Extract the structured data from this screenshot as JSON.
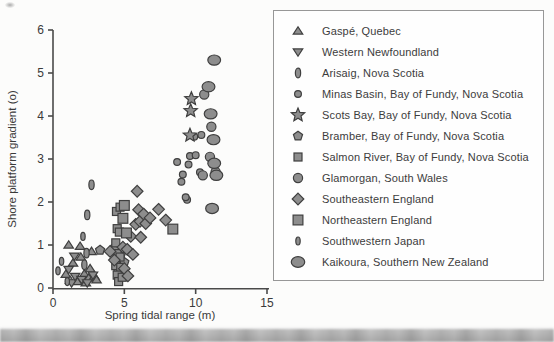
{
  "figure": {
    "background": "#fcfcfb",
    "axis_color": "#4a4a4a",
    "text_color": "#3a3a3a",
    "legend_border_color": "#979797",
    "marker_fill": "#8d8d8d",
    "marker_stroke": "#3f3f3f"
  },
  "chart_data": {
    "type": "scatter",
    "title": "",
    "xlabel": "Spring tidal range (m)",
    "ylabel": "Shore platform gradient (o)",
    "xlim": [
      0,
      15
    ],
    "ylim": [
      0,
      6
    ],
    "xticks": [
      0,
      5,
      10,
      15
    ],
    "yticks": [
      0,
      1,
      2,
      3,
      4,
      5,
      6
    ],
    "grid": false,
    "legend_position": "right-box",
    "series": [
      {
        "name": "Gaspé, Quebec",
        "marker": "triangle-up",
        "size": 5,
        "points": [
          [
            0.9,
            0.32
          ],
          [
            1.1,
            1.0
          ],
          [
            1.2,
            0.18
          ],
          [
            1.4,
            0.58
          ],
          [
            1.7,
            0.15
          ],
          [
            1.9,
            0.97
          ],
          [
            1.95,
            0.72
          ],
          [
            2.2,
            0.33
          ],
          [
            2.3,
            0.12
          ],
          [
            2.5,
            0.23
          ],
          [
            2.6,
            0.45
          ],
          [
            2.7,
            0.85
          ],
          [
            2.9,
            0.28
          ],
          [
            3.05,
            0.19
          ]
        ]
      },
      {
        "name": "Western Newfoundland",
        "marker": "triangle-down",
        "size": 5,
        "points": [
          [
            1.1,
            0.43
          ],
          [
            1.3,
            0.12
          ],
          [
            1.5,
            0.74
          ],
          [
            1.55,
            0.27
          ],
          [
            2.0,
            0.2
          ],
          [
            2.4,
            0.12
          ],
          [
            2.8,
            0.3
          ]
        ]
      },
      {
        "name": "Arisaig, Nova Scotia",
        "marker": "ellipse-v",
        "size": 4.8,
        "points": [
          [
            2.7,
            2.4
          ],
          [
            2.4,
            1.7
          ],
          [
            2.35,
            0.81
          ],
          [
            2.2,
            0.54
          ]
        ]
      },
      {
        "name": "Minas Basin, Bay of Fundy, Nova Scotia",
        "marker": "circle",
        "size": 3.4,
        "points": [
          [
            8.7,
            2.93
          ],
          [
            9.4,
            2.05
          ],
          [
            9.0,
            2.47
          ],
          [
            9.1,
            2.64
          ],
          [
            9.3,
            2.11
          ],
          [
            9.5,
            2.87
          ],
          [
            9.6,
            3.07
          ],
          [
            9.9,
            3.52
          ],
          [
            10.0,
            3.09
          ],
          [
            10.3,
            2.69
          ],
          [
            10.4,
            3.56
          ]
        ]
      },
      {
        "name": "Scots Bay, Bay of Fundy, Nova Scotia",
        "marker": "star",
        "size": 7,
        "points": [
          [
            9.7,
            4.4
          ],
          [
            9.65,
            4.12
          ],
          [
            9.6,
            3.55
          ]
        ]
      },
      {
        "name": "Bramber, Bay of Fundy, Nova Scotia",
        "marker": "pentagon",
        "size": 4.8,
        "points": [
          [
            3.3,
            0.88
          ],
          [
            4.35,
            0.95
          ],
          [
            4.8,
            0.82
          ],
          [
            5.0,
            0.6
          ],
          [
            4.55,
            0.42
          ]
        ]
      },
      {
        "name": "Salmon River, Bay of Fundy, Nova Scotia",
        "marker": "square",
        "size": 4,
        "points": [
          [
            4.45,
            1.78
          ],
          [
            4.7,
            1.88
          ],
          [
            4.5,
            1.38
          ],
          [
            4.65,
            1.3
          ],
          [
            4.4,
            1.05
          ],
          [
            4.5,
            0.8
          ],
          [
            4.7,
            0.72
          ],
          [
            4.4,
            0.52
          ],
          [
            4.75,
            0.48
          ],
          [
            4.5,
            0.3
          ],
          [
            4.6,
            0.15
          ],
          [
            4.85,
            0.25
          ]
        ]
      },
      {
        "name": "Glamorgan, South Wales",
        "marker": "circle",
        "size": 4.6,
        "points": [
          [
            10.6,
            4.5
          ],
          [
            11.1,
            3.75
          ],
          [
            11.0,
            3.05
          ],
          [
            10.5,
            2.62
          ],
          [
            11.4,
            2.7
          ]
        ]
      },
      {
        "name": "Southeastern England",
        "marker": "diamond",
        "size": 5.8,
        "points": [
          [
            4.0,
            0.85
          ],
          [
            4.3,
            0.65
          ],
          [
            4.9,
            0.95
          ],
          [
            5.2,
            0.9
          ],
          [
            5.45,
            1.2
          ],
          [
            5.6,
            0.78
          ],
          [
            5.8,
            1.48
          ],
          [
            5.9,
            2.25
          ],
          [
            6.0,
            1.82
          ],
          [
            6.1,
            1.55
          ],
          [
            6.35,
            1.72
          ],
          [
            6.5,
            1.5
          ],
          [
            6.8,
            1.63
          ],
          [
            7.4,
            1.83
          ],
          [
            7.9,
            1.58
          ],
          [
            5.0,
            0.45
          ],
          [
            5.25,
            0.28
          ],
          [
            6.15,
            1.18
          ]
        ]
      },
      {
        "name": "Northeastern England",
        "marker": "square",
        "size": 4.9,
        "points": [
          [
            8.4,
            1.37
          ],
          [
            5.0,
            1.92
          ],
          [
            4.9,
            1.62
          ],
          [
            5.15,
            1.28
          ]
        ]
      },
      {
        "name": "Southwestern Japan",
        "marker": "ellipse-v",
        "size": 4,
        "points": [
          [
            0.35,
            0.4
          ],
          [
            0.6,
            0.62
          ],
          [
            2.1,
            1.2
          ],
          [
            1.0,
            0.15
          ]
        ]
      },
      {
        "name": "Kaikoura, Southern New Zealand",
        "marker": "ellipse-wide",
        "size": 6.4,
        "points": [
          [
            11.3,
            5.3
          ],
          [
            10.9,
            4.68
          ],
          [
            11.05,
            4.05
          ],
          [
            11.25,
            3.45
          ],
          [
            11.3,
            2.9
          ],
          [
            11.45,
            2.62
          ],
          [
            11.15,
            1.85
          ]
        ]
      }
    ]
  }
}
